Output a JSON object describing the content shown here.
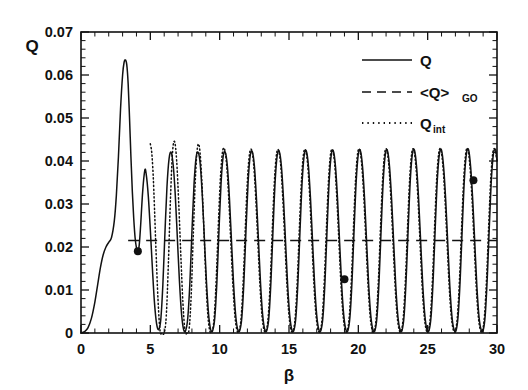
{
  "figure": {
    "background": "#ffffff",
    "ink_color": "#111111",
    "width": 528,
    "height": 390
  },
  "axes": {
    "y_label": "Q",
    "x_label": "β",
    "y_ticks": [
      "0",
      "0.01",
      "0.02",
      "0.03",
      "0.04",
      "0.05",
      "0.06",
      "0.07"
    ],
    "x_ticks": [
      "0",
      "5",
      "10",
      "15",
      "20",
      "25",
      "30"
    ]
  },
  "legend": {
    "items": [
      {
        "key": "q",
        "label": "Q",
        "sub": "",
        "style": "solid"
      },
      {
        "key": "qgo",
        "label": "<Q>",
        "sub": "GO",
        "style": "dashed"
      },
      {
        "key": "qint",
        "label": "Q",
        "sub": "int",
        "style": "dotted"
      }
    ]
  },
  "chart_data": {
    "type": "line",
    "title": "",
    "xlabel": "β",
    "ylabel": "Q",
    "xlim": [
      0,
      30
    ],
    "ylim": [
      0,
      0.07
    ],
    "xticks": [
      0,
      5,
      10,
      15,
      20,
      25,
      30
    ],
    "yticks": [
      0,
      0.01,
      0.02,
      0.03,
      0.04,
      0.05,
      0.06,
      0.07
    ],
    "xtick_minor_step": 1,
    "ytick_minor_step": 0.002,
    "grid": false,
    "legend_position": "upper-right-inside",
    "series": [
      {
        "name": "Q",
        "style": "solid",
        "x": [
          0.0,
          0.25,
          0.5,
          0.75,
          1.0,
          1.2,
          1.4,
          1.6,
          1.8,
          2.0,
          2.2,
          2.4,
          2.55,
          2.7,
          2.85,
          3.0,
          3.1,
          3.2,
          3.3,
          3.4,
          3.5,
          3.6,
          3.7,
          3.8,
          3.9,
          4.0,
          4.1,
          4.2,
          4.3,
          4.45,
          4.6,
          4.7,
          4.85,
          5.0,
          5.15,
          5.3,
          5.45,
          5.6,
          5.75,
          5.9,
          6.05,
          6.2,
          6.35,
          6.5,
          6.65,
          6.8,
          6.95,
          7.1,
          7.25,
          7.4,
          7.55,
          7.7,
          7.85,
          8.0,
          8.15,
          8.3,
          8.45,
          8.6,
          8.75,
          8.9,
          9.05,
          9.2,
          9.35,
          9.5,
          9.65,
          9.8,
          9.95,
          10.1,
          10.25,
          10.4,
          10.55,
          10.7,
          10.85,
          11.0,
          11.15,
          11.3,
          11.45,
          11.6,
          11.75,
          11.9,
          12.05,
          12.2,
          12.35,
          12.5,
          12.65,
          12.8,
          12.95,
          13.1,
          13.25,
          13.4,
          13.55,
          13.7,
          13.85,
          14.0,
          14.15,
          14.3,
          14.45,
          14.6,
          14.75,
          14.9,
          15.05,
          15.2,
          15.35,
          15.5,
          15.65,
          15.8,
          15.95,
          16.1,
          16.25,
          16.4,
          16.55,
          16.7,
          16.85,
          17.0,
          17.15,
          17.3,
          17.45,
          17.6,
          17.75,
          17.9,
          18.05,
          18.2,
          18.35,
          18.5,
          18.65,
          18.8,
          18.95,
          19.1,
          19.25,
          19.4,
          19.55,
          19.7,
          19.85,
          20.0,
          20.15,
          20.3,
          20.45,
          20.6,
          20.75,
          20.9,
          21.05,
          21.2,
          21.35,
          21.5,
          21.65,
          21.8,
          21.95,
          22.1,
          22.25,
          22.4,
          22.55,
          22.7,
          22.85,
          23.0,
          23.15,
          23.3,
          23.45,
          23.6,
          23.75,
          23.9,
          24.05,
          24.2,
          24.35,
          24.5,
          24.65,
          24.8,
          24.95,
          25.1,
          25.25,
          25.4,
          25.55,
          25.7,
          25.85,
          26.0,
          26.15,
          26.3,
          26.45,
          26.6,
          26.75,
          26.9,
          27.05,
          27.2,
          27.35,
          27.5,
          27.65,
          27.8,
          27.95,
          28.1,
          28.25,
          28.4,
          28.55,
          28.7,
          28.85,
          29.0,
          29.15,
          29.3,
          29.45,
          29.6,
          29.75,
          29.9,
          30.0
        ],
        "y": [
          0.0,
          0.0003,
          0.0012,
          0.0034,
          0.0072,
          0.0112,
          0.0152,
          0.0182,
          0.02,
          0.0211,
          0.0222,
          0.026,
          0.032,
          0.041,
          0.052,
          0.06,
          0.0628,
          0.0635,
          0.0624,
          0.058,
          0.05,
          0.041,
          0.033,
          0.0268,
          0.0222,
          0.0198,
          0.019,
          0.0205,
          0.025,
          0.033,
          0.0378,
          0.037,
          0.032,
          0.024,
          0.015,
          0.007,
          0.0022,
          0.0008,
          0.003,
          0.011,
          0.023,
          0.034,
          0.0405,
          0.042,
          0.039,
          0.032,
          0.022,
          0.012,
          0.0045,
          0.0008,
          0.0006,
          0.0035,
          0.0115,
          0.0235,
          0.0345,
          0.0408,
          0.042,
          0.0392,
          0.0318,
          0.0218,
          0.0118,
          0.0044,
          0.0008,
          0.0006,
          0.0036,
          0.0118,
          0.0238,
          0.0348,
          0.041,
          0.0421,
          0.039,
          0.0316,
          0.0216,
          0.0116,
          0.0043,
          0.0008,
          0.0006,
          0.0037,
          0.012,
          0.024,
          0.035,
          0.0412,
          0.0422,
          0.039,
          0.0315,
          0.0214,
          0.0114,
          0.0042,
          0.0008,
          0.0006,
          0.0037,
          0.0121,
          0.0242,
          0.0352,
          0.0413,
          0.0422,
          0.0389,
          0.0314,
          0.0213,
          0.0113,
          0.0042,
          0.0008,
          0.0006,
          0.0038,
          0.0122,
          0.0243,
          0.0353,
          0.0414,
          0.0423,
          0.0389,
          0.0313,
          0.0212,
          0.0112,
          0.0041,
          0.0008,
          0.0006,
          0.0038,
          0.0123,
          0.0244,
          0.0354,
          0.0415,
          0.0423,
          0.0388,
          0.0312,
          0.0211,
          0.0111,
          0.0041,
          0.0008,
          0.0006,
          0.0039,
          0.0124,
          0.0245,
          0.0355,
          0.0416,
          0.0424,
          0.0388,
          0.0312,
          0.021,
          0.011,
          0.004,
          0.0008,
          0.0006,
          0.0039,
          0.0125,
          0.0246,
          0.0356,
          0.0416,
          0.0424,
          0.0387,
          0.0311,
          0.021,
          0.011,
          0.004,
          0.0008,
          0.0006,
          0.004,
          0.0126,
          0.0247,
          0.0357,
          0.0417,
          0.0425,
          0.0387,
          0.031,
          0.0209,
          0.0109,
          0.004,
          0.0008,
          0.0006,
          0.004,
          0.0127,
          0.0248,
          0.0358,
          0.0417,
          0.0425,
          0.0386,
          0.031,
          0.0208,
          0.0108,
          0.0039,
          0.0008,
          0.0006,
          0.0041,
          0.0128,
          0.0249,
          0.0359,
          0.0418,
          0.0426,
          0.0386,
          0.0309,
          0.0208,
          0.0108,
          0.0039,
          0.0008,
          0.0006,
          0.0041,
          0.0129,
          0.025,
          0.036,
          0.0418,
          0.0426,
          0.04
        ]
      },
      {
        "name": "Q_int",
        "style": "dotted",
        "x": [
          5.0,
          5.1,
          5.2,
          5.3,
          5.4,
          5.55,
          5.7,
          5.85,
          6.0,
          6.15,
          6.3,
          6.45,
          6.6,
          6.75,
          6.9,
          7.05,
          7.2,
          7.35,
          7.5,
          7.65,
          7.8,
          7.95,
          8.1,
          8.25,
          8.4,
          8.55,
          8.7,
          8.85,
          9.0,
          9.15,
          9.3,
          9.45,
          9.6,
          9.75,
          9.9,
          10.05,
          10.2,
          10.35,
          10.5,
          10.65,
          10.8,
          10.95,
          11.1,
          11.25,
          11.4,
          11.55,
          11.7,
          11.85,
          12.0,
          12.15,
          12.3,
          12.45,
          12.6,
          12.75,
          12.9,
          13.05,
          13.2,
          13.35,
          13.5,
          13.65,
          13.8,
          13.95,
          14.1,
          14.25,
          14.4,
          14.55,
          14.7,
          14.85,
          15.0,
          15.15,
          15.3,
          15.45,
          15.6,
          15.75,
          15.9,
          16.05,
          16.2,
          16.35,
          16.5,
          16.65,
          16.8,
          16.95,
          17.1,
          17.25,
          17.4,
          17.55,
          17.7,
          17.85,
          18.0,
          18.15,
          18.3,
          18.45,
          18.6,
          18.75,
          18.9,
          19.05,
          19.2,
          19.35,
          19.5,
          19.65,
          19.8,
          19.95,
          20.1,
          20.25,
          20.4,
          20.55,
          20.7,
          20.85,
          21.0,
          21.15,
          21.3,
          21.45,
          21.6,
          21.75,
          21.9,
          22.05,
          22.2,
          22.35,
          22.5,
          22.65,
          22.8,
          22.95,
          23.1,
          23.25,
          23.4,
          23.55,
          23.7,
          23.85,
          24.0,
          24.15,
          24.3,
          24.45,
          24.6,
          24.75,
          24.9,
          25.05,
          25.2,
          25.35,
          25.5,
          25.65,
          25.8,
          25.95,
          26.1,
          26.25,
          26.4,
          26.55,
          26.7,
          26.85,
          27.0,
          27.15,
          27.3,
          27.45,
          27.6,
          27.75,
          27.9,
          28.05,
          28.2,
          28.35,
          28.5,
          28.65,
          28.8,
          28.95,
          29.1,
          29.25,
          29.4,
          29.55,
          29.7,
          29.85,
          30.0
        ],
        "y": [
          0.044,
          0.042,
          0.037,
          0.029,
          0.02,
          0.008,
          0.0005,
          0.0,
          0.0,
          0.004,
          0.016,
          0.031,
          0.042,
          0.0445,
          0.04,
          0.03,
          0.018,
          0.007,
          0.0005,
          0.0,
          0.001,
          0.009,
          0.023,
          0.036,
          0.0432,
          0.043,
          0.0362,
          0.025,
          0.013,
          0.004,
          0.0004,
          0.0004,
          0.0034,
          0.0124,
          0.0248,
          0.0358,
          0.042,
          0.0428,
          0.0392,
          0.0316,
          0.0214,
          0.0114,
          0.004,
          0.0006,
          0.0005,
          0.0036,
          0.0122,
          0.0244,
          0.0354,
          0.0416,
          0.0426,
          0.0392,
          0.0316,
          0.0214,
          0.0114,
          0.0041,
          0.0007,
          0.0005,
          0.0037,
          0.0122,
          0.0244,
          0.0354,
          0.0416,
          0.0425,
          0.0391,
          0.0315,
          0.0213,
          0.0113,
          0.0041,
          0.0007,
          0.0005,
          0.0038,
          0.0123,
          0.0245,
          0.0355,
          0.0417,
          0.0425,
          0.039,
          0.0314,
          0.0212,
          0.0112,
          0.0041,
          0.0007,
          0.0005,
          0.0038,
          0.0124,
          0.0245,
          0.0355,
          0.0417,
          0.0425,
          0.039,
          0.0313,
          0.0212,
          0.0112,
          0.0041,
          0.0007,
          0.0005,
          0.0039,
          0.0125,
          0.0246,
          0.0356,
          0.0418,
          0.0426,
          0.0389,
          0.0313,
          0.0211,
          0.0111,
          0.004,
          0.0007,
          0.0005,
          0.0039,
          0.0125,
          0.0246,
          0.0356,
          0.0418,
          0.0426,
          0.0389,
          0.0312,
          0.0211,
          0.0111,
          0.004,
          0.0007,
          0.0005,
          0.004,
          0.0126,
          0.0247,
          0.0357,
          0.0418,
          0.0426,
          0.0388,
          0.0312,
          0.021,
          0.011,
          0.004,
          0.0007,
          0.0005,
          0.004,
          0.0127,
          0.0248,
          0.0358,
          0.0419,
          0.0426,
          0.0388,
          0.0311,
          0.021,
          0.011,
          0.004,
          0.0007,
          0.0005,
          0.0041,
          0.0127,
          0.0248,
          0.0358,
          0.0419,
          0.0427,
          0.0387,
          0.0311,
          0.0209,
          0.0109,
          0.0039,
          0.0007,
          0.0005,
          0.0041,
          0.0128,
          0.0249,
          0.0359,
          0.0419,
          0.0427,
          0.04
        ]
      },
      {
        "name": "<Q>GO",
        "style": "dashed",
        "constant_y": 0.0215,
        "x": [
          3.4,
          30.0
        ],
        "y": [
          0.0215,
          0.0215
        ]
      }
    ],
    "markers": [
      {
        "x": 4.1,
        "y": 0.019
      },
      {
        "x": 19.0,
        "y": 0.0125
      },
      {
        "x": 28.3,
        "y": 0.0355
      }
    ]
  }
}
